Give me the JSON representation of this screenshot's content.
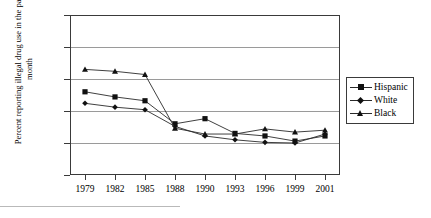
{
  "chart_data": {
    "type": "line",
    "title": "",
    "xlabel": "",
    "ylabel": "Percent reporting illegal drug use in the past month",
    "categories": [
      "1979",
      "1982",
      "1985",
      "1988",
      "1990",
      "1993",
      "1996",
      "1999",
      "2001"
    ],
    "yticks": [
      "0",
      "5",
      "10",
      "15",
      "20",
      "25"
    ],
    "ylim": [
      0,
      25
    ],
    "grid": true,
    "legend_position": "right",
    "series": [
      {
        "name": "Hispanic",
        "marker": "square",
        "values": [
          13.0,
          12.2,
          11.6,
          8.0,
          8.8,
          6.5,
          6.1,
          5.3,
          6.1
        ]
      },
      {
        "name": "White",
        "marker": "diamond",
        "values": [
          11.2,
          10.6,
          10.2,
          7.6,
          6.1,
          5.5,
          5.1,
          5.0,
          6.4
        ]
      },
      {
        "name": "Black",
        "marker": "triangle",
        "values": [
          16.5,
          16.2,
          15.7,
          7.3,
          6.4,
          6.4,
          7.2,
          6.7,
          7.0
        ]
      }
    ]
  },
  "legend": {
    "items": [
      {
        "label": "Hispanic"
      },
      {
        "label": "White"
      },
      {
        "label": "Black"
      }
    ]
  },
  "axis": {
    "y_title": "Percent reporting illegal drug use in the past month"
  }
}
